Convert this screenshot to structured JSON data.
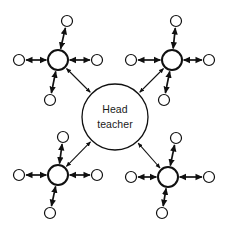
{
  "diagram": {
    "type": "hub-and-spoke-network",
    "canvas": {
      "width": 230,
      "height": 234,
      "background": "#ffffff"
    },
    "style": {
      "stroke_color": "#101010",
      "node_fill": "#ffffff",
      "text_color": "#1a1a1a",
      "arrow_style": "double-headed"
    },
    "center": {
      "id": "head-teacher",
      "label_line_1": "Head",
      "label_line_2": "teacher",
      "cx": 115,
      "cy": 117,
      "r": 33
    },
    "hubs": [
      {
        "id": "hub-top-left",
        "cx": 58,
        "cy": 60,
        "r": 10,
        "leaves": [
          {
            "id": "leaf-tl-up",
            "cx": 67,
            "cy": 21,
            "r": 5.5
          },
          {
            "id": "leaf-tl-left",
            "cx": 19,
            "cy": 60,
            "r": 5.5
          },
          {
            "id": "leaf-tl-right",
            "cx": 97,
            "cy": 60,
            "r": 5.5
          },
          {
            "id": "leaf-tl-down",
            "cx": 50,
            "cy": 100,
            "r": 5.5
          }
        ]
      },
      {
        "id": "hub-top-right",
        "cx": 172,
        "cy": 60,
        "r": 10,
        "leaves": [
          {
            "id": "leaf-tr-up",
            "cx": 176,
            "cy": 21,
            "r": 5.5
          },
          {
            "id": "leaf-tr-left",
            "cx": 131,
            "cy": 60,
            "r": 5.5
          },
          {
            "id": "leaf-tr-right",
            "cx": 209,
            "cy": 60,
            "r": 5.5
          },
          {
            "id": "leaf-tr-down",
            "cx": 164,
            "cy": 100,
            "r": 5.5
          }
        ]
      },
      {
        "id": "hub-bottom-left",
        "cx": 58,
        "cy": 175,
        "r": 10,
        "leaves": [
          {
            "id": "leaf-bl-up",
            "cx": 63,
            "cy": 137,
            "r": 5.5
          },
          {
            "id": "leaf-bl-left",
            "cx": 19,
            "cy": 175,
            "r": 5.5
          },
          {
            "id": "leaf-bl-right",
            "cx": 97,
            "cy": 175,
            "r": 5.5
          },
          {
            "id": "leaf-bl-down",
            "cx": 50,
            "cy": 213,
            "r": 5.5
          }
        ]
      },
      {
        "id": "hub-bottom-right",
        "cx": 168,
        "cy": 177,
        "r": 10,
        "leaves": [
          {
            "id": "leaf-br-up",
            "cx": 176,
            "cy": 138,
            "r": 5.5
          },
          {
            "id": "leaf-br-left",
            "cx": 131,
            "cy": 177,
            "r": 5.5
          },
          {
            "id": "leaf-br-right",
            "cx": 209,
            "cy": 177,
            "r": 5.5
          },
          {
            "id": "leaf-br-down",
            "cx": 162,
            "cy": 213,
            "r": 5.5
          }
        ]
      }
    ],
    "connectors": [
      {
        "id": "conn-center-top-left",
        "from": "hub-top-left",
        "to": "head-teacher"
      },
      {
        "id": "conn-center-top-right",
        "from": "hub-top-right",
        "to": "head-teacher"
      },
      {
        "id": "conn-center-bottom-left",
        "from": "hub-bottom-left",
        "to": "head-teacher"
      },
      {
        "id": "conn-center-bottom-right",
        "from": "hub-bottom-right",
        "to": "head-teacher"
      }
    ]
  }
}
